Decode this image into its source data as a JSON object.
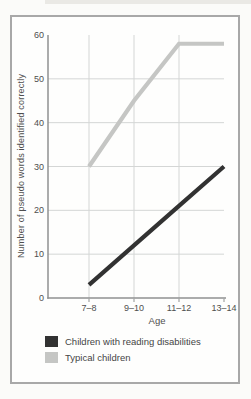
{
  "figure": {
    "frame_border_color": "#a8a8a8",
    "background_color": "#fefefd"
  },
  "chart_data": {
    "type": "line",
    "title": "",
    "categories": [
      "7–8",
      "9–10",
      "11–12",
      "13–14"
    ],
    "series": [
      {
        "name": "Children with reading disabilities",
        "color": "#323232",
        "values": [
          3,
          12,
          21,
          30
        ]
      },
      {
        "name": "Typical children",
        "color": "#c5c6c4",
        "values": [
          30,
          45,
          58,
          58
        ]
      }
    ],
    "xlabel": "Age",
    "ylabel": "Number of pseudo words identified correctly",
    "ylim": [
      0,
      60
    ],
    "yticks": [
      0,
      10,
      20,
      30,
      40,
      50,
      60
    ],
    "grid": true,
    "legend_position": "bottom-left",
    "style": {
      "gridline": "#d4d6d5",
      "axis": "#8f9190",
      "text": "#4e4e4e"
    }
  }
}
